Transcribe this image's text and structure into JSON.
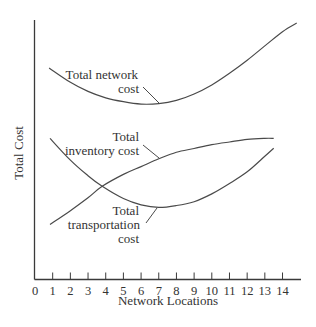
{
  "chart_data": {
    "type": "line",
    "title": "",
    "xlabel": "Network Locations",
    "ylabel": "Total Cost",
    "xlim": [
      0,
      15
    ],
    "ylim": [
      0,
      100
    ],
    "x_ticks": [
      0,
      1,
      2,
      3,
      4,
      5,
      6,
      7,
      8,
      9,
      10,
      11,
      12,
      13,
      14
    ],
    "y_ticks": [],
    "grid": false,
    "legend": "none (inline curve labels)",
    "series": [
      {
        "name": "Total network cost",
        "x": [
          0.8,
          2,
          3,
          4,
          5,
          6,
          7,
          8,
          9,
          10,
          11,
          12,
          13,
          14,
          14.8
        ],
        "values": [
          81.5,
          76,
          72.5,
          70,
          68.5,
          67.6,
          67.8,
          69,
          71.5,
          75,
          79.5,
          84.5,
          90,
          95.5,
          98.8
        ],
        "label_lines": [
          "Total network",
          "cost"
        ]
      },
      {
        "name": "Total inventory cost",
        "x": [
          0.85,
          2,
          3,
          3.8,
          5,
          6,
          7,
          8,
          9,
          10,
          11,
          12,
          13,
          13.5
        ],
        "values": [
          21.2,
          26.5,
          31.5,
          35.9,
          40.5,
          43.5,
          46.5,
          49,
          50.5,
          52,
          53,
          54,
          54.4,
          54.4
        ],
        "label_lines": [
          "Total",
          "inventory cost"
        ]
      },
      {
        "name": "Total transportation cost",
        "x": [
          0.85,
          2,
          3,
          3.8,
          5,
          6,
          7,
          8,
          9,
          10,
          11,
          12,
          13,
          13.5
        ],
        "values": [
          54.4,
          46,
          40,
          35.9,
          31.2,
          28.8,
          27.8,
          28.5,
          30,
          33,
          37,
          41.5,
          47.5,
          50.6
        ],
        "label_lines": [
          "Total",
          "transportation",
          "cost"
        ]
      }
    ],
    "annotations": [
      "Total network cost",
      "Total inventory cost",
      "Total transportation cost"
    ]
  },
  "axes": {
    "x_title": "Network Locations",
    "y_title": "Total Cost",
    "x_tick_labels": [
      "0",
      "1",
      "2",
      "3",
      "4",
      "5",
      "6",
      "7",
      "8",
      "9",
      "10",
      "11",
      "12",
      "13",
      "14"
    ]
  },
  "labels": {
    "network": {
      "line1": "Total network",
      "line2": "cost"
    },
    "inventory": {
      "line1": "Total",
      "line2": "inventory cost"
    },
    "transportation": {
      "line1": "Total",
      "line2": "transportation",
      "line3": "cost"
    }
  },
  "colors": {
    "line": "#4a4a4a",
    "axis": "#3a3a3a",
    "text": "#333333",
    "background": "#ffffff"
  }
}
